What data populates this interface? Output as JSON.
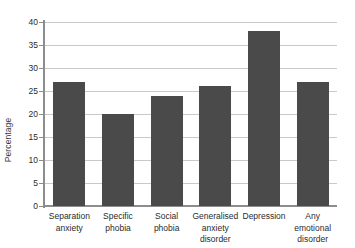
{
  "chart_data": {
    "type": "bar",
    "title": "",
    "xlabel": "",
    "ylabel": "Percentage",
    "ylim": [
      0,
      40
    ],
    "ytick_step": 5,
    "grid": true,
    "legend": "none",
    "bar_color": "#4a4a4a",
    "gridline_color": "#c9c9c9",
    "axis_color": "#8d8d8d",
    "background_color": "#ffffff",
    "categories": [
      "Separation anxiety",
      "Specific phobia",
      "Social phobia",
      "Generalised anxiety disorder",
      "Depression",
      "Any emotional disorder"
    ],
    "category_lines": [
      [
        "Separation",
        "anxiety"
      ],
      [
        "Specific",
        "phobia"
      ],
      [
        "Social",
        "phobia"
      ],
      [
        "Generalised",
        "anxiety",
        "disorder"
      ],
      [
        "Depression"
      ],
      [
        "Any",
        "emotional",
        "disorder"
      ]
    ],
    "values": [
      27,
      20,
      24,
      26,
      38,
      27
    ],
    "ytick_labels": [
      "0",
      "5",
      "10",
      "15",
      "20",
      "25",
      "30",
      "35",
      "40"
    ],
    "ytick_values": [
      0,
      5,
      10,
      15,
      20,
      25,
      30,
      35,
      40
    ]
  }
}
